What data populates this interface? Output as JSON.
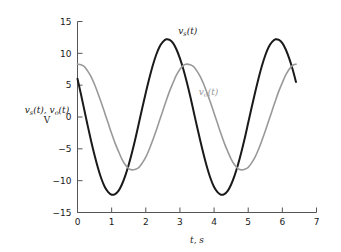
{
  "chart_data": {
    "type": "line",
    "title": "",
    "xlabel": "t, s",
    "ylabel": "v_s(t), v_o(t)  V",
    "ylabel_line1": "v",
    "ylabel_sub1": "s",
    "ylabel_mid": "(t), v",
    "ylabel_sub2": "o",
    "ylabel_end": "(t)",
    "ylabel_line2": "V",
    "xlim": [
      0,
      7
    ],
    "ylim": [
      -15,
      15
    ],
    "xticks": [
      "0",
      "1",
      "2",
      "3",
      "4",
      "5",
      "6",
      "7"
    ],
    "xtick_values": [
      0,
      1,
      2,
      3,
      4,
      5,
      6,
      7
    ],
    "yticks": [
      "15",
      "10",
      "5",
      "0",
      "−5",
      "−10",
      "−15"
    ],
    "ytick_values": [
      15,
      10,
      5,
      0,
      -5,
      -10,
      -15
    ],
    "grid": false,
    "legend_position": "inline-annotation",
    "series": [
      {
        "name": "v_s(t)",
        "label_main": "v",
        "label_sub": "s",
        "label_tail": "(t)",
        "color": "#1a1a1a",
        "linewidth": 2.0,
        "amplitude": 12.2,
        "period": 3.14,
        "phase_offset_s": 0.0,
        "t_start": 0.0,
        "t_end": 6.4,
        "value_at_t0": 6.0,
        "points": [
          [
            0.0,
            6.0
          ],
          [
            0.1,
            3.6
          ],
          [
            0.2,
            1.1
          ],
          [
            0.3,
            -1.4
          ],
          [
            0.4,
            -3.8
          ],
          [
            0.5,
            -6.0
          ],
          [
            0.6,
            -8.0
          ],
          [
            0.7,
            -9.7
          ],
          [
            0.8,
            -11.0
          ],
          [
            0.9,
            -11.8
          ],
          [
            1.0,
            -12.2
          ],
          [
            1.1,
            -12.1
          ],
          [
            1.2,
            -11.6
          ],
          [
            1.3,
            -10.6
          ],
          [
            1.4,
            -9.2
          ],
          [
            1.5,
            -7.5
          ],
          [
            1.6,
            -5.5
          ],
          [
            1.7,
            -3.3
          ],
          [
            1.8,
            -0.9
          ],
          [
            1.9,
            1.5
          ],
          [
            2.0,
            3.8
          ],
          [
            2.1,
            6.0
          ],
          [
            2.2,
            8.0
          ],
          [
            2.3,
            9.7
          ],
          [
            2.4,
            11.0
          ],
          [
            2.5,
            11.8
          ],
          [
            2.6,
            12.2
          ],
          [
            2.7,
            12.1
          ],
          [
            2.8,
            11.6
          ],
          [
            2.9,
            10.6
          ],
          [
            3.0,
            9.2
          ],
          [
            3.1,
            7.5
          ],
          [
            3.2,
            5.5
          ],
          [
            3.3,
            3.3
          ],
          [
            3.4,
            0.9
          ],
          [
            3.5,
            -1.5
          ],
          [
            3.6,
            -3.8
          ],
          [
            3.7,
            -6.0
          ],
          [
            3.8,
            -8.0
          ],
          [
            3.9,
            -9.7
          ],
          [
            4.0,
            -11.0
          ],
          [
            4.1,
            -11.8
          ],
          [
            4.2,
            -12.2
          ],
          [
            4.3,
            -12.1
          ],
          [
            4.4,
            -11.6
          ],
          [
            4.5,
            -10.6
          ],
          [
            4.6,
            -9.2
          ],
          [
            4.7,
            -7.5
          ],
          [
            4.8,
            -5.5
          ],
          [
            4.9,
            -3.3
          ],
          [
            5.0,
            -0.9
          ],
          [
            5.1,
            1.5
          ],
          [
            5.2,
            3.8
          ],
          [
            5.3,
            6.0
          ],
          [
            5.4,
            8.0
          ],
          [
            5.5,
            9.7
          ],
          [
            5.6,
            11.0
          ],
          [
            5.7,
            11.8
          ],
          [
            5.8,
            12.2
          ],
          [
            5.9,
            12.1
          ],
          [
            6.0,
            11.6
          ],
          [
            6.1,
            10.6
          ],
          [
            6.2,
            9.2
          ],
          [
            6.3,
            7.5
          ],
          [
            6.4,
            5.5
          ]
        ]
      },
      {
        "name": "v_o(t)",
        "label_main": "v",
        "label_sub": "o",
        "label_tail": "(t)",
        "color": "#999999",
        "linewidth": 1.6,
        "amplitude": 8.3,
        "period": 3.14,
        "phase_offset_s": 0.45,
        "t_start": 0.0,
        "t_end": 6.4,
        "value_at_t0": 8.3,
        "points": [
          [
            0.0,
            8.3
          ],
          [
            0.1,
            8.2
          ],
          [
            0.2,
            7.9
          ],
          [
            0.3,
            7.2
          ],
          [
            0.4,
            6.3
          ],
          [
            0.5,
            5.1
          ],
          [
            0.6,
            3.7
          ],
          [
            0.7,
            2.2
          ],
          [
            0.8,
            0.6
          ],
          [
            0.9,
            -1.0
          ],
          [
            1.0,
            -2.6
          ],
          [
            1.1,
            -4.1
          ],
          [
            1.2,
            -5.4
          ],
          [
            1.3,
            -6.6
          ],
          [
            1.4,
            -7.5
          ],
          [
            1.5,
            -8.1
          ],
          [
            1.6,
            -8.3
          ],
          [
            1.7,
            -8.2
          ],
          [
            1.8,
            -7.9
          ],
          [
            1.9,
            -7.2
          ],
          [
            2.0,
            -6.3
          ],
          [
            2.1,
            -5.1
          ],
          [
            2.2,
            -3.7
          ],
          [
            2.3,
            -2.2
          ],
          [
            2.4,
            -0.6
          ],
          [
            2.5,
            1.0
          ],
          [
            2.6,
            2.6
          ],
          [
            2.7,
            4.1
          ],
          [
            2.8,
            5.4
          ],
          [
            2.9,
            6.6
          ],
          [
            3.0,
            7.5
          ],
          [
            3.1,
            8.1
          ],
          [
            3.2,
            8.3
          ],
          [
            3.3,
            8.2
          ],
          [
            3.4,
            7.9
          ],
          [
            3.5,
            7.2
          ],
          [
            3.6,
            6.3
          ],
          [
            3.7,
            5.1
          ],
          [
            3.8,
            3.7
          ],
          [
            3.9,
            2.2
          ],
          [
            4.0,
            0.6
          ],
          [
            4.1,
            -1.0
          ],
          [
            4.2,
            -2.6
          ],
          [
            4.3,
            -4.1
          ],
          [
            4.4,
            -5.4
          ],
          [
            4.5,
            -6.6
          ],
          [
            4.6,
            -7.5
          ],
          [
            4.7,
            -8.1
          ],
          [
            4.8,
            -8.3
          ],
          [
            4.9,
            -8.2
          ],
          [
            5.0,
            -7.9
          ],
          [
            5.1,
            -7.2
          ],
          [
            5.2,
            -6.3
          ],
          [
            5.3,
            -5.1
          ],
          [
            5.4,
            -3.7
          ],
          [
            5.5,
            -2.2
          ],
          [
            5.6,
            -0.6
          ],
          [
            5.7,
            1.0
          ],
          [
            5.8,
            2.6
          ],
          [
            5.9,
            4.1
          ],
          [
            6.0,
            5.4
          ],
          [
            6.1,
            6.6
          ],
          [
            6.2,
            7.5
          ],
          [
            6.3,
            8.1
          ],
          [
            6.4,
            8.3
          ]
        ]
      }
    ],
    "annotations": [
      {
        "text": "v_s(t)",
        "t": 2.95,
        "v": 13.0
      },
      {
        "text": "v_o(t)",
        "t": 3.55,
        "v": 3.4
      }
    ]
  },
  "colors": {
    "series_primary": "#1a1a1a",
    "series_secondary": "#999999",
    "axis": "#555555",
    "text": "#1a1a1a",
    "background": "#ffffff"
  }
}
